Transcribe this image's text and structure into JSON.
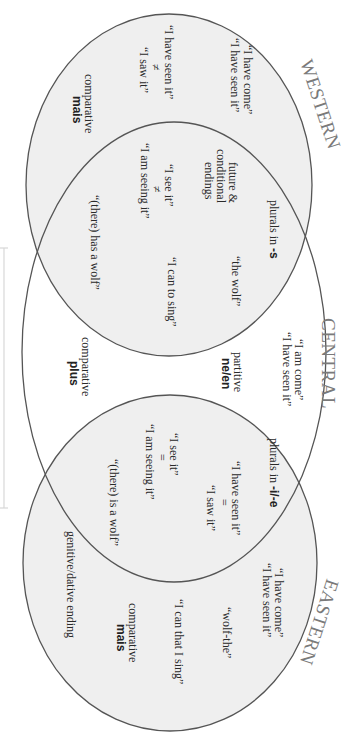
{
  "diagram": {
    "type": "venn",
    "orientation": "rotated-90-clockwise",
    "colors": {
      "circle_fill": "#f0f0f0",
      "central_fill": "#ffffff",
      "stroke": "#555555",
      "title": "#7a7a7a",
      "text": "#2a2a2a"
    },
    "sets": {
      "western": {
        "title": "WESTERN",
        "only": {
          "perfect": [
            "“I have come”",
            "“I have seen it”"
          ],
          "past": [
            "“I have seen it”",
            "≠",
            "“I saw it”"
          ],
          "comparative": [
            "comparative",
            "mais"
          ]
        }
      },
      "central": {
        "title": "CENTRAL",
        "only": {
          "perfect": [
            "“I am come”",
            "“I have seen it”"
          ],
          "partitive": [
            "partitive",
            "ne/en"
          ],
          "comparative": [
            "comparative",
            "plus"
          ]
        }
      },
      "eastern": {
        "title": "EASTERN",
        "only": {
          "perfect": [
            "“I have come”",
            "“I have seen it”"
          ],
          "article": "“wolf-the”",
          "infinitive": "“I can that I sing”",
          "comparative": [
            "comparative",
            "mais"
          ],
          "case": "genitive/dative ending"
        }
      }
    },
    "overlaps": {
      "western_central": {
        "plurals": "plurals in ",
        "plurals_suffix": "-s",
        "future": [
          "future &",
          "conditional",
          "endings"
        ],
        "progressive": [
          "“I see it”",
          "≠",
          "“I am seeing it”"
        ],
        "existential": "“(there) has a wolf”",
        "article": "“the wolf”",
        "infinitive": "“I can to sing”"
      },
      "central_eastern": {
        "plurals": "plurals in ",
        "plurals_suffix": "-i/-e",
        "past": [
          "“I have seen it”",
          "=",
          "“I saw it”"
        ],
        "progressive": [
          "“I see it”",
          "=",
          "“I am seeing it”"
        ],
        "existential": "“(there) is a wolf”"
      }
    }
  }
}
